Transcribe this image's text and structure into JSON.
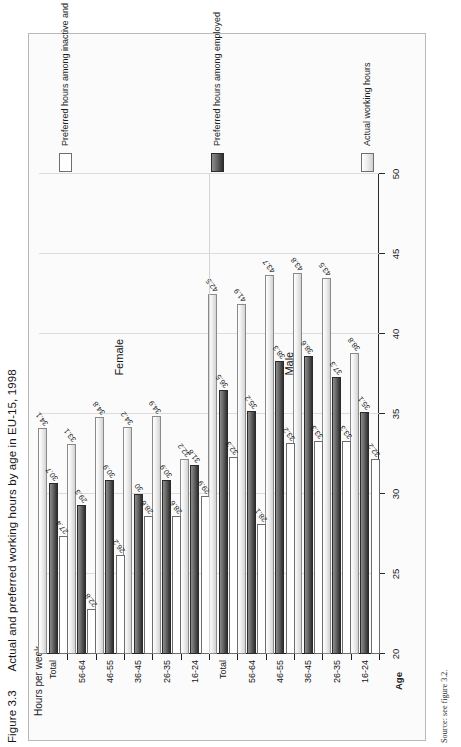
{
  "figure": {
    "number": "Figure 3.3",
    "title": "Actual and preferred working hours by age in EU-15, 1998",
    "source": "Source: see figure 3.2."
  },
  "legend": {
    "items": [
      {
        "key": "actual",
        "label": "Actual working hours",
        "style": "light-gradient"
      },
      {
        "key": "preferred_employed",
        "label": "Preferred hours among employed",
        "style": "dark-gradient"
      },
      {
        "key": "preferred_inactive",
        "label": "Preferred hours among inactive and unemployed",
        "style": "white"
      }
    ]
  },
  "axes": {
    "value_axis_label": "Hours per week",
    "category_axis_label": "Age",
    "ticks": [
      "20",
      "25",
      "30",
      "35",
      "40",
      "45",
      "50"
    ],
    "tick_values": [
      20,
      25,
      30,
      35,
      40,
      45,
      50
    ],
    "range": [
      20,
      50
    ]
  },
  "groups": [
    {
      "name": "Male",
      "label": "Male"
    },
    {
      "name": "Female",
      "label": "Female"
    }
  ],
  "chart_data": {
    "type": "bar",
    "orientation": "horizontal",
    "title": "Actual and preferred working hours by age in EU-15, 1998",
    "xlabel": "Age",
    "ylabel": "Hours per week",
    "ylim": [
      20,
      50
    ],
    "grid": true,
    "legend_position": "right",
    "categories": [
      "Male 16-24",
      "Male 26-35",
      "Male 36-45",
      "Male 46-55",
      "Male 56-64",
      "Male Total",
      "Female 16-24",
      "Female 26-35",
      "Female 36-45",
      "Female 46-55",
      "Female 56-64",
      "Female Total"
    ],
    "category_labels": [
      "16-24",
      "26-35",
      "36-45",
      "46-55",
      "56-64",
      "Total",
      "16-24",
      "26-35",
      "36-45",
      "46-55",
      "56-64",
      "Total"
    ],
    "series": [
      {
        "name": "Actual working hours",
        "values": [
          38.8,
          43.5,
          43.8,
          43.7,
          41.9,
          42.5,
          32.2,
          34.9,
          34.2,
          34.8,
          33.1,
          34.1
        ]
      },
      {
        "name": "Preferred hours among employed",
        "values": [
          35.1,
          37.3,
          38.6,
          38.3,
          35.2,
          36.5,
          31.8,
          30.9,
          30.0,
          30.9,
          29.3,
          30.7
        ]
      },
      {
        "name": "Preferred hours among inactive and unemployed",
        "values": [
          32.2,
          33.3,
          33.3,
          33.2,
          28.1,
          32.3,
          29.9,
          28.6,
          28.6,
          26.2,
          22.8,
          27.4
        ]
      }
    ],
    "bar_labels": [
      [
        "38.8",
        "43.5",
        "43.8",
        "43.7",
        "41.9",
        "42.5",
        "32.2",
        "34.9",
        "34.2",
        "34.8",
        "33.1",
        "34.1"
      ],
      [
        "35.1",
        "37.3",
        "38.6",
        "38.3",
        "35.2",
        "36.5",
        "31.8",
        "30.9",
        "30",
        "30.9",
        "29.3",
        "30.7"
      ],
      [
        "32.2",
        "33.3",
        "33.3",
        "33.2",
        "28.1",
        "32.3",
        "29.9",
        "28.6",
        "28.6",
        "26.2",
        "22.8",
        "27.4"
      ]
    ]
  }
}
